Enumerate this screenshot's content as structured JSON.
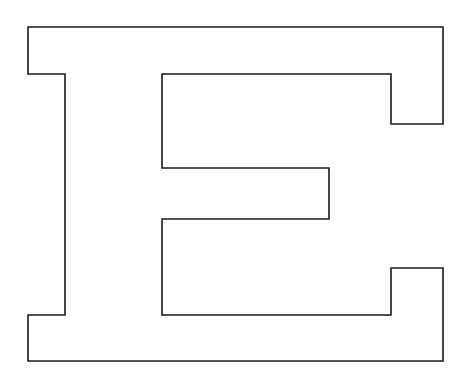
{
  "figure": {
    "letter": "E",
    "stroke_color": "#1a1a1a",
    "fill_color": "#ffffff",
    "background": "#ffffff",
    "stroke_width": 1.6,
    "outline_points": "28,27 443,27 443,124 391,124 391,74 162,74 162,168 329,168 329,219 162,219 162,315 391,315 391,268 443,268 443,361 28,361 28,315 65,315 65,74 28,74"
  }
}
